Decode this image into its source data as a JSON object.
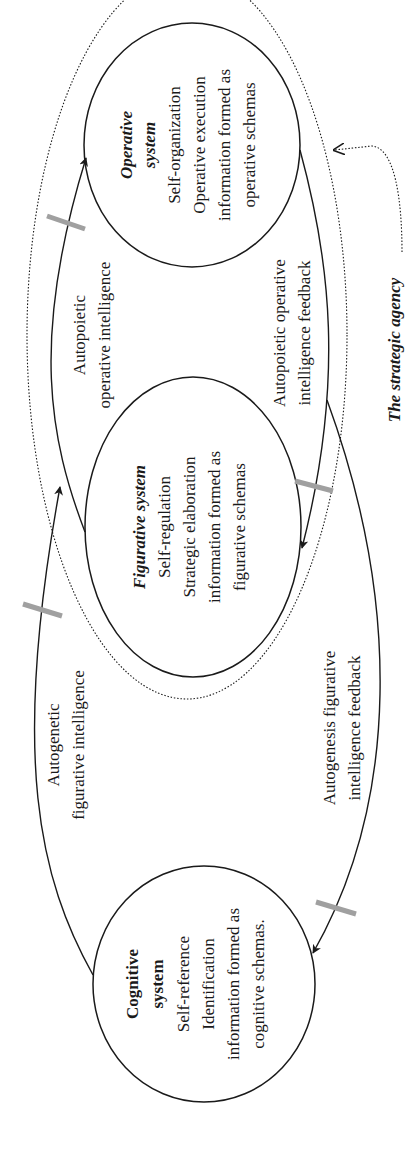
{
  "diagram": {
    "orientation": "rotated-90-ccw",
    "nodes": {
      "operative": {
        "title_line1": "Operative",
        "title_line2": "system",
        "lines": [
          "Self-organization",
          "Operative execution",
          "information formed as",
          "operative schemas"
        ]
      },
      "figurative": {
        "title": "Figurative system",
        "lines": [
          "Self-regulation",
          "Strategic elaboration",
          "information formed as",
          "figurative schemas"
        ]
      },
      "cognitive": {
        "title_line1": "Cognitive",
        "title_line2": "system",
        "lines": [
          "Self-reference",
          "Identification",
          "information formed as",
          "cognitive schemas."
        ]
      }
    },
    "edges": {
      "autopoietic_operative": {
        "line1": "Autopoietic",
        "line2": "operative intelligence"
      },
      "autopoietic_feedback": {
        "line1": "Autopoietic operative",
        "line2": "intelligence feedback"
      },
      "autogenetic_figurative": {
        "line1": "Autogenetic",
        "line2": "figurative intelligence"
      },
      "autogenesis_feedback": {
        "line1": "Autogenesis figurative",
        "line2": "intelligence feedback"
      }
    },
    "boundary_label": "The strategic agency",
    "colors": {
      "stroke": "#1a1a1a",
      "tick": "#a0a0a0",
      "background": "#ffffff"
    }
  }
}
